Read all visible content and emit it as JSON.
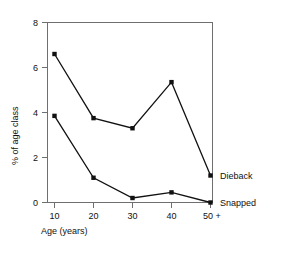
{
  "chart_data": {
    "type": "line",
    "title": "",
    "xlabel": "Age (years)",
    "ylabel": "% of age class",
    "categories": [
      "10",
      "20",
      "30",
      "40",
      "50 +"
    ],
    "x": [
      10,
      20,
      30,
      40,
      50
    ],
    "xlim": [
      5,
      55
    ],
    "ylim": [
      0,
      8
    ],
    "yticks": [
      0,
      2,
      4,
      6,
      8
    ],
    "ytick_labels": [
      "0",
      "2",
      "4",
      "6",
      "8"
    ],
    "xtick_labels": [
      "10",
      "20",
      "30",
      "40",
      "50 +"
    ],
    "grid": false,
    "legend_position": "right-inline",
    "series": [
      {
        "name": "Dieback",
        "values": [
          6.6,
          3.75,
          3.3,
          5.35,
          1.2
        ],
        "marker": "filled-square",
        "color": "#111111"
      },
      {
        "name": "Snapped",
        "values": [
          3.85,
          1.1,
          0.2,
          0.45,
          0.0
        ],
        "marker": "filled-square",
        "color": "#111111"
      }
    ],
    "annotations": [
      {
        "text": "Dieback",
        "series": "Dieback",
        "at_x": "50 +"
      },
      {
        "text": "Snapped",
        "series": "Snapped",
        "at_x": "50 +"
      }
    ]
  },
  "axes": {
    "y_tick_0": "0",
    "y_tick_1": "2",
    "y_tick_2": "4",
    "y_tick_3": "6",
    "y_tick_4": "8",
    "x_tick_0": "10",
    "x_tick_1": "20",
    "x_tick_2": "30",
    "x_tick_3": "40",
    "x_tick_4": "50 +",
    "x_title": "Age (years)",
    "y_title": "% of age class"
  },
  "labels": {
    "dieback": "Dieback",
    "snapped": "Snapped"
  },
  "colors": {
    "line": "#111111",
    "axis": "#6f6f6f",
    "background": "#ffffff",
    "text": "#111111"
  }
}
